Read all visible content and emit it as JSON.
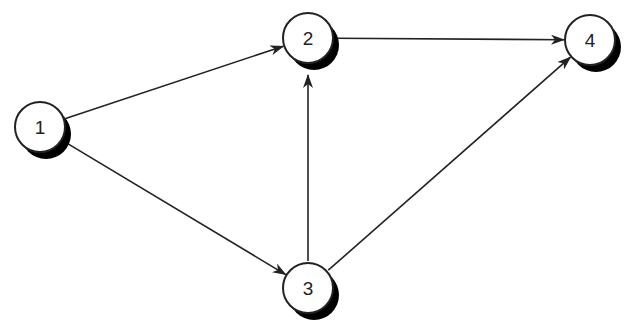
{
  "diagram": {
    "type": "directed-graph",
    "colors": {
      "stroke": "#222222",
      "fill": "#ffffff",
      "shadow": "#000000"
    },
    "nodes": [
      {
        "id": "1",
        "label": "1",
        "x": 40,
        "y": 127
      },
      {
        "id": "2",
        "label": "2",
        "x": 308,
        "y": 38
      },
      {
        "id": "3",
        "label": "3",
        "x": 308,
        "y": 288
      },
      {
        "id": "4",
        "label": "4",
        "x": 590,
        "y": 40
      }
    ],
    "edges": [
      {
        "from": "1",
        "to": "2"
      },
      {
        "from": "1",
        "to": "3"
      },
      {
        "from": "2",
        "to": "4"
      },
      {
        "from": "3",
        "to": "2"
      },
      {
        "from": "3",
        "to": "4"
      }
    ]
  }
}
